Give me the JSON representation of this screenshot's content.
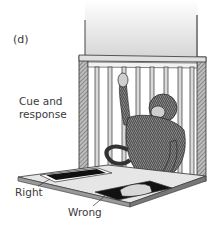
{
  "figure": {
    "panel_label": "(d)",
    "labels": {
      "cue_and_response": [
        "Cue and",
        "response"
      ],
      "right": "Right",
      "wrong": "Wrong"
    },
    "colors": {
      "background": "#ffffff",
      "ink": "#2a2a2a",
      "wall_gradient_top": "#ffffff",
      "wall_gradient_bottom": "#d8d8d8",
      "tray": "#e6e6e6",
      "card_black": "#111111"
    }
  }
}
